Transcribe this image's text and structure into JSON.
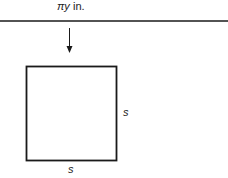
{
  "diagram": {
    "top_label": {
      "variable": "πy",
      "unit": " in."
    },
    "square": {
      "side_right_label": "s",
      "side_bottom_label": "s"
    },
    "colors": {
      "stroke": "#1a1a1a",
      "background": "#ffffff"
    }
  }
}
